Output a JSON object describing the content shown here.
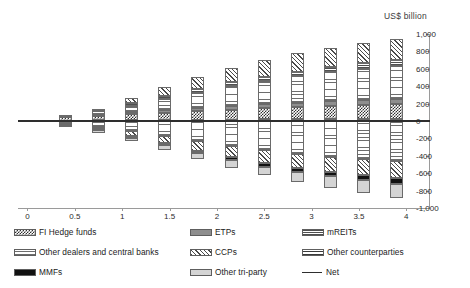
{
  "axis_unit_label": "US$ billion",
  "chart_data": {
    "type": "bar",
    "subtype": "stacked-diverging",
    "title": "",
    "subtitle": "",
    "xlabel": "",
    "ylabel": "US$ billion",
    "ylim": [
      -1000,
      1000
    ],
    "ytick_labels": [
      "1,000",
      "800",
      "600",
      "400",
      "200",
      "0",
      "-200",
      "-400",
      "-600",
      "-800",
      "-1,000"
    ],
    "ytick_values": [
      1000,
      800,
      600,
      400,
      200,
      0,
      -200,
      -400,
      -600,
      -800,
      -1000
    ],
    "xtick_labels": [
      "0",
      "0.5",
      "1",
      "1.5",
      "2",
      "2.5",
      "3",
      "3.5",
      "4"
    ],
    "xtick_values": [
      0,
      0.5,
      1,
      1.5,
      2,
      2.5,
      3,
      3.5,
      4
    ],
    "grid": false,
    "legend_position": "bottom",
    "categories": [
      0.4,
      0.75,
      1.1,
      1.45,
      1.8,
      2.15,
      2.5,
      2.85,
      3.2,
      3.55,
      3.9
    ],
    "series": [
      {
        "name": "CCPs",
        "pattern": "diagonal-hatch",
        "side": "positive",
        "values": [
          0,
          0,
          60,
          100,
          140,
          170,
          190,
          210,
          225,
          240,
          250
        ]
      },
      {
        "name": "mREITs",
        "pattern": "horizontal-dense",
        "side": "positive",
        "values": [
          0,
          25,
          30,
          35,
          40,
          45,
          50,
          55,
          58,
          60,
          62
        ]
      },
      {
        "name": "Other dealers and central banks",
        "pattern": "dot-grid",
        "side": "positive",
        "values": [
          25,
          40,
          80,
          130,
          180,
          230,
          270,
          305,
          335,
          360,
          380
        ]
      },
      {
        "name": "ETPs",
        "pattern": "solid-grey",
        "side": "positive",
        "values": [
          0,
          10,
          18,
          25,
          32,
          38,
          44,
          50,
          55,
          60,
          65
        ]
      },
      {
        "name": "FI Hedge funds",
        "pattern": "checkerboard",
        "side": "positive",
        "values": [
          40,
          55,
          70,
          85,
          100,
          115,
          128,
          138,
          148,
          158,
          165
        ]
      },
      {
        "name": "Other counterparties",
        "pattern": "horizontal-wide",
        "side": "positive",
        "values": [
          5,
          8,
          10,
          12,
          14,
          16,
          18,
          20,
          22,
          24,
          26
        ]
      },
      {
        "name": "Other dealers and central banks",
        "pattern": "dot-grid",
        "side": "negative",
        "values": [
          -40,
          -70,
          -120,
          -175,
          -235,
          -290,
          -335,
          -375,
          -410,
          -440,
          -465
        ]
      },
      {
        "name": "CCPs",
        "pattern": "diagonal-hatch",
        "side": "negative",
        "values": [
          0,
          -25,
          -55,
          -80,
          -105,
          -125,
          -145,
          -160,
          -175,
          -185,
          -195
        ]
      },
      {
        "name": "MMFs",
        "pattern": "solid-black",
        "side": "negative",
        "values": [
          -8,
          -14,
          -20,
          -26,
          -32,
          -38,
          -44,
          -48,
          -52,
          -56,
          -60
        ]
      },
      {
        "name": "Other tri-party",
        "pattern": "light-grey",
        "side": "negative",
        "values": [
          -15,
          -25,
          -40,
          -55,
          -70,
          -85,
          -100,
          -115,
          -130,
          -145,
          -160
        ]
      }
    ],
    "net_line": {
      "name": "Net",
      "values": [
        0,
        0,
        0,
        0,
        0,
        0,
        0,
        0,
        0,
        0,
        0
      ],
      "style": "solid-black-line"
    }
  },
  "legend": {
    "column_1": [
      {
        "label": "FI Hedge funds",
        "swatch": "checkerboard"
      },
      {
        "label": "Other dealers and central banks",
        "swatch": "dot-grid"
      },
      {
        "label": "MMFs",
        "swatch": "solid-black"
      }
    ],
    "column_2": [
      {
        "label": "ETPs",
        "swatch": "solid-grey"
      },
      {
        "label": "CCPs",
        "swatch": "diagonal-hatch"
      },
      {
        "label": "Other tri-party",
        "swatch": "light-grey"
      }
    ],
    "column_3": [
      {
        "label": "mREITs",
        "swatch": "horizontal-dense"
      },
      {
        "label": "Other counterparties",
        "swatch": "horizontal-wide"
      },
      {
        "label": "Net",
        "swatch": "line"
      }
    ]
  }
}
